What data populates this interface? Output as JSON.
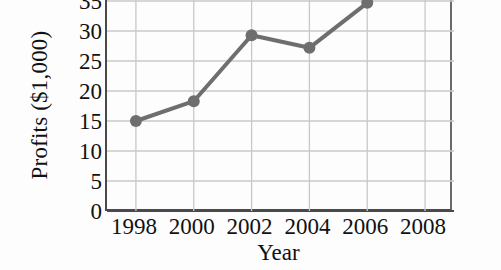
{
  "chart_data": {
    "type": "line",
    "title": "",
    "xlabel": "Year",
    "ylabel": "Profits ($1,000)",
    "x": [
      1998,
      2000,
      2002,
      2004,
      2006
    ],
    "values": [
      15.0,
      18.3,
      29.3,
      27.2,
      34.7
    ],
    "series": [
      {
        "name": "Profits",
        "values": [
          15.0,
          18.3,
          29.3,
          27.2,
          34.7
        ],
        "color": "#6e6e6e",
        "marker": "circle",
        "line_width": 4
      }
    ],
    "xlim": [
      1997,
      2009
    ],
    "ylim": [
      0,
      36.5
    ],
    "x_ticks": [
      1998,
      2000,
      2002,
      2004,
      2006,
      2008
    ],
    "x_tick_labels": [
      "1998",
      "2000",
      "2002",
      "2004",
      "2006",
      "2008"
    ],
    "y_ticks": [
      0,
      5,
      10,
      15,
      20,
      25,
      30,
      35
    ],
    "y_tick_labels": [
      "0",
      "5",
      "10",
      "15",
      "20",
      "25",
      "30",
      "35"
    ],
    "grid": true,
    "grid_axes": "both",
    "grid_color": "#c8c8c8",
    "axis_color": "#4a4a4a",
    "legend": false,
    "legend_position": "none",
    "background": "#fdfdfd",
    "note_top_cropped": true
  }
}
